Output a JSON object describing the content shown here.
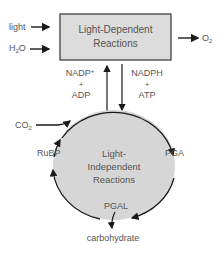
{
  "diagram": {
    "top_box": {
      "line1": "Light-Dependent",
      "line2": "Reactions",
      "fill": "#dcdcdc"
    },
    "cycle": {
      "line1": "Light-",
      "line2": "Independent",
      "line3": "Reactions",
      "fill": "#d6d6d6"
    },
    "inputs": {
      "light": "light",
      "water": "H",
      "water_sub": "2",
      "water_end": "O",
      "co2": "CO",
      "co2_sub": "2"
    },
    "outputs": {
      "oxygen": "O",
      "oxygen_sub": "2",
      "carbohydrate": "carbohydrate"
    },
    "left_exchange": {
      "line1": "NADP",
      "sup": "+",
      "plus": "+",
      "line3": "ADP"
    },
    "right_exchange": {
      "line1": "NADPH",
      "plus": "+",
      "line3": "ATP"
    },
    "cycle_labels": {
      "rubp": "RuBP",
      "pga": "PGA",
      "pgal": "PGAL"
    },
    "colors": {
      "line": "#1a1a1a",
      "text": "#555555"
    }
  }
}
